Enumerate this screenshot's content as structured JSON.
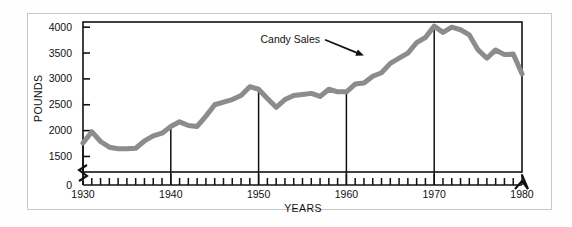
{
  "chart_data": {
    "type": "line",
    "title": "",
    "xlabel": "YEARS",
    "ylabel": "POUNDS",
    "xlim": [
      1930,
      1980
    ],
    "ylim": [
      1200,
      4100
    ],
    "grid": false,
    "legend_position": "none",
    "axis_break_y": true,
    "axis_break_x": true,
    "ytick_labels": [
      "0",
      "1500",
      "2000",
      "2500",
      "3000",
      "3500",
      "4000"
    ],
    "ytick_values": [
      0,
      1500,
      2000,
      2500,
      3000,
      3500,
      4000
    ],
    "xtick_labels": [
      "1930",
      "1940",
      "1950",
      "1960",
      "1970",
      "1980"
    ],
    "xtick_values": [
      1930,
      1940,
      1950,
      1960,
      1970,
      1980
    ],
    "minor_xtick_step": 1,
    "annotations": [
      {
        "text": "Candy Sales",
        "x": 1957,
        "y": 3700,
        "arrow_to_x": 1962,
        "arrow_to_y": 3450
      }
    ],
    "series": [
      {
        "name": "Candy Sales",
        "color": "#8c8c8c",
        "line_width": 5,
        "x": [
          1930,
          1931,
          1932,
          1933,
          1934,
          1935,
          1936,
          1937,
          1938,
          1939,
          1940,
          1941,
          1942,
          1943,
          1944,
          1945,
          1946,
          1947,
          1948,
          1949,
          1950,
          1951,
          1952,
          1953,
          1954,
          1955,
          1956,
          1957,
          1958,
          1959,
          1960,
          1961,
          1962,
          1963,
          1964,
          1965,
          1966,
          1967,
          1968,
          1969,
          1970,
          1971,
          1972,
          1973,
          1974,
          1975,
          1976,
          1977,
          1978,
          1979,
          1980
        ],
        "values": [
          1760,
          1980,
          1790,
          1680,
          1650,
          1650,
          1660,
          1800,
          1900,
          1950,
          2080,
          2170,
          2100,
          2080,
          2280,
          2500,
          2550,
          2600,
          2680,
          2850,
          2800,
          2620,
          2450,
          2600,
          2680,
          2700,
          2720,
          2660,
          2800,
          2750,
          2750,
          2900,
          2920,
          3050,
          3120,
          3300,
          3400,
          3500,
          3700,
          3800,
          4020,
          3900,
          4000,
          3950,
          3850,
          3560,
          3400,
          3560,
          3470,
          3480,
          3100
        ]
      }
    ],
    "drop_lines": [
      1930,
      1940,
      1950,
      1960,
      1970
    ]
  },
  "axis": {
    "y_title": "POUNDS",
    "x_title": "YEARS"
  }
}
